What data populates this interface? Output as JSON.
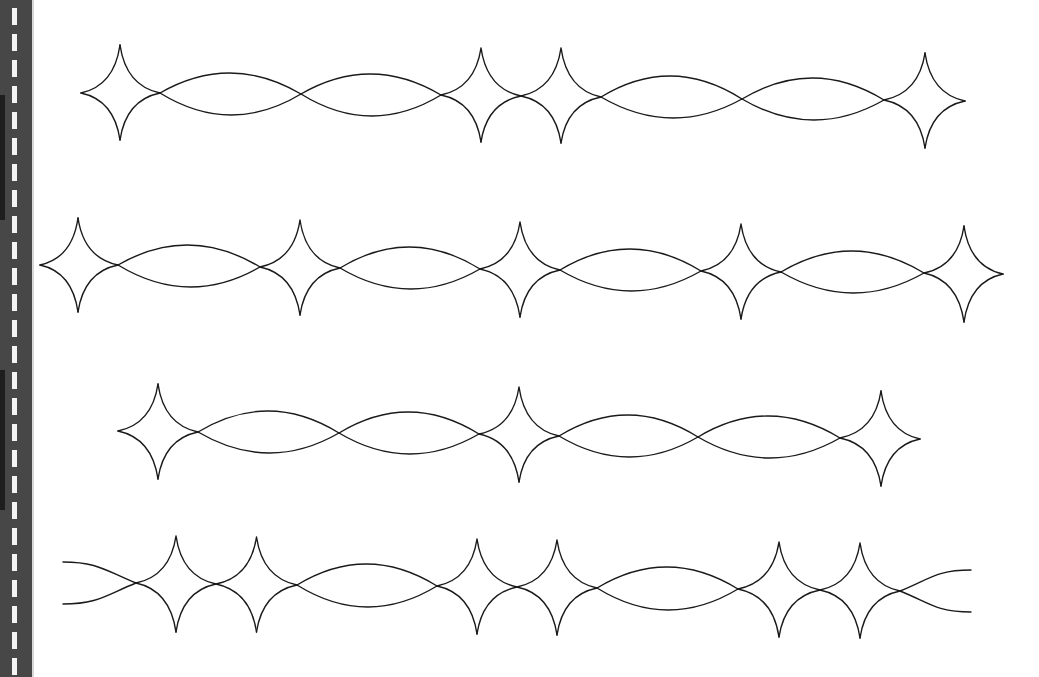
{
  "page": {
    "background": "#ffffff",
    "line_color": "#1a1a1a"
  },
  "left_strip": {
    "color": "#474747",
    "dash_color": "#f4f4f4",
    "dash_count": 26,
    "dash_period": 26,
    "dash_offset": 8,
    "dark_bands": [
      {
        "top": 95,
        "height": 125
      },
      {
        "top": 370,
        "height": 140
      }
    ]
  },
  "rows": [
    {
      "name": "row-1",
      "left_end": {
        "type": "tip",
        "x": 81,
        "y": 93
      },
      "right_end": {
        "type": "tip",
        "x": 965,
        "y": 101
      },
      "nodes": [
        {
          "x": 160,
          "y": 93
        },
        {
          "x": 301,
          "y": 94
        },
        {
          "x": 441,
          "y": 95
        },
        {
          "x": 521,
          "y": 96
        },
        {
          "x": 601,
          "y": 97
        },
        {
          "x": 742,
          "y": 99
        },
        {
          "x": 884,
          "y": 100
        }
      ],
      "first_star": {
        "cx": 120,
        "top": 45,
        "bottom": 140
      },
      "last_star": {
        "cx": 925,
        "top": 53,
        "bottom": 148
      },
      "segments": [
        {
          "type": "lens",
          "top": 73,
          "bottom": 115
        },
        {
          "type": "lens",
          "top": 74,
          "bottom": 116
        },
        {
          "type": "star",
          "top": 48,
          "bottom": 142
        },
        {
          "type": "star",
          "top": 48,
          "bottom": 143
        },
        {
          "type": "lens",
          "top": 76,
          "bottom": 118
        },
        {
          "type": "lens",
          "top": 78,
          "bottom": 120
        }
      ]
    },
    {
      "name": "row-2",
      "left_end": {
        "type": "tip",
        "x": 40,
        "y": 265
      },
      "right_end": {
        "type": "tip",
        "x": 1003,
        "y": 274
      },
      "nodes": [
        {
          "x": 118,
          "y": 265
        },
        {
          "x": 260,
          "y": 267
        },
        {
          "x": 340,
          "y": 268
        },
        {
          "x": 480,
          "y": 269
        },
        {
          "x": 560,
          "y": 270
        },
        {
          "x": 701,
          "y": 271
        },
        {
          "x": 781,
          "y": 272
        },
        {
          "x": 924,
          "y": 273
        }
      ],
      "first_star": {
        "cx": 78,
        "top": 218,
        "bottom": 312
      },
      "last_star": {
        "cx": 964,
        "top": 226,
        "bottom": 322
      },
      "segments": [
        {
          "type": "lens",
          "top": 245,
          "bottom": 287
        },
        {
          "type": "star",
          "top": 220,
          "bottom": 315
        },
        {
          "type": "lens",
          "top": 247,
          "bottom": 289
        },
        {
          "type": "star",
          "top": 222,
          "bottom": 317
        },
        {
          "type": "lens",
          "top": 249,
          "bottom": 291
        },
        {
          "type": "star",
          "top": 224,
          "bottom": 319
        },
        {
          "type": "lens",
          "top": 251,
          "bottom": 293
        }
      ]
    },
    {
      "name": "row-3",
      "left_end": {
        "type": "tip",
        "x": 118,
        "y": 431
      },
      "right_end": {
        "type": "tip",
        "x": 920,
        "y": 439
      },
      "nodes": [
        {
          "x": 198,
          "y": 432
        },
        {
          "x": 339,
          "y": 433
        },
        {
          "x": 479,
          "y": 434
        },
        {
          "x": 559,
          "y": 436
        },
        {
          "x": 698,
          "y": 437
        },
        {
          "x": 840,
          "y": 438
        }
      ],
      "first_star": {
        "cx": 158,
        "top": 384,
        "bottom": 479
      },
      "last_star": {
        "cx": 881,
        "top": 391,
        "bottom": 486
      },
      "segments": [
        {
          "type": "lens",
          "top": 411,
          "bottom": 453
        },
        {
          "type": "lens",
          "top": 412,
          "bottom": 454
        },
        {
          "type": "star",
          "top": 387,
          "bottom": 482
        },
        {
          "type": "lens",
          "top": 415,
          "bottom": 457
        },
        {
          "type": "lens",
          "top": 416,
          "bottom": 458
        }
      ]
    },
    {
      "name": "row-4",
      "left_end": {
        "type": "open",
        "x": 63,
        "y_top": 562,
        "y_bottom": 604
      },
      "right_end": {
        "type": "open",
        "x": 971,
        "y_top": 570,
        "y_bottom": 612
      },
      "nodes": [
        {
          "x": 136,
          "y": 583
        },
        {
          "x": 216,
          "y": 584
        },
        {
          "x": 297,
          "y": 585
        },
        {
          "x": 437,
          "y": 586
        },
        {
          "x": 517,
          "y": 587
        },
        {
          "x": 597,
          "y": 588
        },
        {
          "x": 738,
          "y": 589
        },
        {
          "x": 820,
          "y": 590
        },
        {
          "x": 900,
          "y": 591
        }
      ],
      "segments": [
        {
          "type": "star",
          "top": 536,
          "bottom": 632
        },
        {
          "type": "star",
          "top": 537,
          "bottom": 632
        },
        {
          "type": "lens",
          "top": 564,
          "bottom": 607
        },
        {
          "type": "star",
          "top": 539,
          "bottom": 634
        },
        {
          "type": "star",
          "top": 540,
          "bottom": 635
        },
        {
          "type": "lens",
          "top": 567,
          "bottom": 610
        },
        {
          "type": "star",
          "top": 542,
          "bottom": 637
        },
        {
          "type": "star",
          "top": 543,
          "bottom": 638
        }
      ]
    }
  ]
}
